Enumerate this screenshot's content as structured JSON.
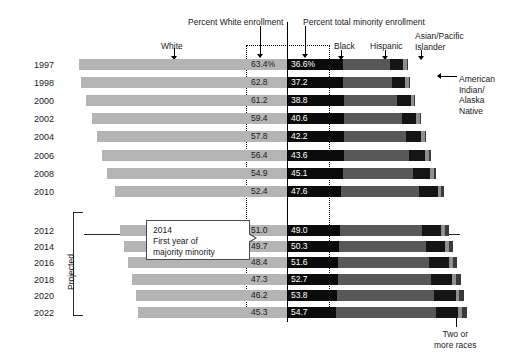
{
  "chart_data": {
    "type": "bar",
    "title": "",
    "subtitle": "",
    "orientation": "horizontal",
    "stacked": true,
    "xlabel": "",
    "ylabel": "",
    "categories": [
      "1997",
      "1998",
      "2000",
      "2002",
      "2004",
      "2006",
      "2008",
      "2010",
      "2012",
      "2014",
      "2016",
      "2018",
      "2020",
      "2022"
    ],
    "series": [
      {
        "name": "White",
        "values": [
          63.4,
          62.8,
          61.2,
          59.4,
          57.8,
          56.4,
          54.9,
          52.4,
          51.0,
          49.7,
          48.4,
          47.3,
          46.2,
          45.3
        ]
      },
      {
        "name": "Total minority",
        "values": [
          36.6,
          37.2,
          38.8,
          40.6,
          42.2,
          43.6,
          45.1,
          47.6,
          49.0,
          50.3,
          51.6,
          52.7,
          53.8,
          54.7
        ]
      },
      {
        "name": "Black",
        "values": [
          16.9,
          16.9,
          17.2,
          17.2,
          17.2,
          17.2,
          16.9,
          16.4,
          16.0,
          15.8,
          15.5,
          15.2,
          14.9,
          14.6
        ]
      },
      {
        "name": "Hispanic",
        "values": [
          14.4,
          14.9,
          16.0,
          17.5,
          18.7,
          19.8,
          21.3,
          23.6,
          25.0,
          26.2,
          27.4,
          28.5,
          29.6,
          30.5
        ]
      },
      {
        "name": "Asian/Pacific Islander",
        "values": [
          3.9,
          4.0,
          4.2,
          4.4,
          4.7,
          4.9,
          5.2,
          5.6,
          5.8,
          6.0,
          6.2,
          6.4,
          6.6,
          6.8
        ]
      },
      {
        "name": "American Indian/Alaska Native",
        "values": [
          1.2,
          1.2,
          1.2,
          1.2,
          1.2,
          1.2,
          1.2,
          1.2,
          1.1,
          1.1,
          1.1,
          1.1,
          1.1,
          1.1
        ]
      },
      {
        "name": "Two or more races",
        "values": [
          0.2,
          0.2,
          0.2,
          0.3,
          0.4,
          0.5,
          0.5,
          0.8,
          1.1,
          1.2,
          1.4,
          1.5,
          1.6,
          1.7
        ]
      }
    ],
    "value_labels_white": [
      "63.4%",
      "62.8",
      "61.2",
      "59.4",
      "57.8",
      "56.4",
      "54.9",
      "52.4",
      "51.0",
      "49.7",
      "48.4",
      "47.3",
      "46.2",
      "45.3"
    ],
    "value_labels_minority": [
      "36.6%",
      "37.2",
      "38.8",
      "40.6",
      "42.2",
      "43.6",
      "45.1",
      "47.6",
      "49.0",
      "50.3",
      "51.6",
      "52.7",
      "53.8",
      "54.7"
    ],
    "projected_categories": [
      "2012",
      "2014",
      "2016",
      "2018",
      "2020",
      "2022"
    ],
    "grid": false,
    "legend_position": "top"
  },
  "headers": {
    "percent_white": "Percent White enrollment",
    "percent_minority": "Percent total minority enrollment"
  },
  "legend": {
    "white": "White",
    "black": "Black",
    "hispanic": "Hispanic",
    "asian": "Asian/Pacific\nIslander",
    "aian": "American\nIndian/\nAlaska\nNative",
    "two": "Two or\nmore races"
  },
  "annotations": {
    "projected": "Projected",
    "callout_line1": "2014",
    "callout_line2": "First year of",
    "callout_line3": "majority minority"
  },
  "colors": {
    "white_seg": "#b4b4b4",
    "black_seg": "#0b0b0b",
    "hispanic_seg": "#585858",
    "asian_seg": "#151515",
    "aian_seg": "#8f8f8f",
    "two_seg": "#3a3a3a",
    "text": "#1a1a1a"
  }
}
